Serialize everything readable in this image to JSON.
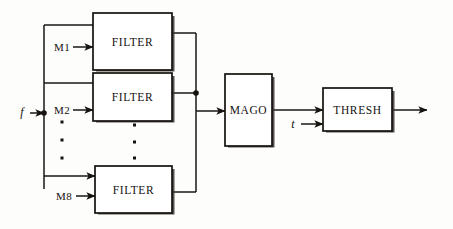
{
  "diagram": {
    "type": "signal-flow-block-diagram",
    "colors": {
      "ink": "#161310",
      "paper": "#fdfdfb",
      "box_fill": "#ffffff",
      "shadow": "#3a3531"
    },
    "blocks": [
      {
        "id": "filter1",
        "label": "FILTER",
        "x": 93,
        "y": 13,
        "w": 79,
        "h": 57
      },
      {
        "id": "filter2",
        "label": "FILTER",
        "x": 93,
        "y": 73,
        "w": 79,
        "h": 48
      },
      {
        "id": "filter8",
        "label": "FILTER",
        "x": 95,
        "y": 166,
        "w": 77,
        "h": 47
      },
      {
        "id": "mago",
        "label": "MAGO",
        "x": 225,
        "y": 74,
        "w": 47,
        "h": 72
      },
      {
        "id": "thresh",
        "label": "THRESH",
        "x": 323,
        "y": 88,
        "w": 69,
        "h": 43
      }
    ],
    "signals": [
      {
        "id": "input-f",
        "label": "f",
        "style": "italic",
        "x": 22,
        "y": 112
      },
      {
        "id": "coef-m1",
        "label": "M1",
        "style": "roman",
        "x": 54,
        "y": 51
      },
      {
        "id": "coef-m2",
        "label": "M2",
        "style": "roman",
        "x": 54,
        "y": 113
      },
      {
        "id": "coef-m8",
        "label": "M8",
        "style": "roman",
        "x": 55,
        "y": 199
      },
      {
        "id": "thresh-t",
        "label": "t",
        "style": "italic",
        "x": 292,
        "y": 128
      }
    ],
    "ellipsis": {
      "left_column": {
        "x": 62,
        "ys": [
          122,
          140,
          158
        ]
      },
      "middle_column": {
        "x": 134,
        "ys": [
          125,
          142,
          158
        ]
      }
    },
    "nodes": [
      {
        "id": "input-junction",
        "x": 44,
        "y": 113
      },
      {
        "id": "output-junction",
        "x": 196,
        "y": 93
      }
    ],
    "connections": [
      "f -> input bus (vertical trunk at x=44)",
      "bus -> FILTER1 input (top branch, y=25)",
      "bus -> FILTER2 input (y=83)",
      "bus -> FILTER8 input (bottom branch, y=176)",
      "M1 -> FILTER1 (y=47)",
      "M2 -> FILTER2 (y=110)",
      "M8 -> FILTER8 (y=196)",
      "FILTER1 output -> collector bus (x=196, y=33)",
      "FILTER2 output -> collector bus junction (x=196, y=93)",
      "FILTER8 output -> collector bus (x=196, y=192)",
      "collector bus -> MAGO (y=111)",
      "MAGO -> THRESH (y=110)",
      "t -> THRESH (y=124)",
      "THRESH -> output arrow (y=110)"
    ]
  }
}
